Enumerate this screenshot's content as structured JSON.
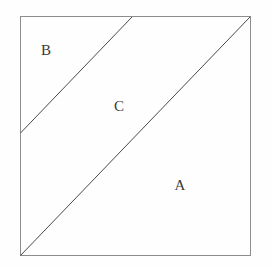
{
  "figure": {
    "kind": "geometry-diagram",
    "background_color": "#fefefe",
    "square": {
      "name": "outer-square",
      "left": 20,
      "top": 16,
      "right": 251,
      "bottom": 256,
      "stroke_color": "#8c8c8c",
      "stroke_width": 1
    },
    "lines": [
      {
        "name": "main-diagonal",
        "from_x": 20,
        "from_y": 256,
        "to_x": 250,
        "to_y": 17,
        "stroke_color": "#4a4a4a",
        "stroke_width": 1
      },
      {
        "name": "upper-parallel-diagonal",
        "from_x": 20,
        "from_y": 133,
        "to_x": 132,
        "to_y": 17,
        "stroke_color": "#4a4a4a",
        "stroke_width": 1
      }
    ],
    "labels": [
      {
        "name": "region-label-b",
        "text": "B",
        "x": 46,
        "y": 50
      },
      {
        "name": "region-label-c",
        "text": "C",
        "x": 119,
        "y": 106
      },
      {
        "name": "region-label-a",
        "text": "A",
        "x": 180,
        "y": 185
      }
    ]
  }
}
